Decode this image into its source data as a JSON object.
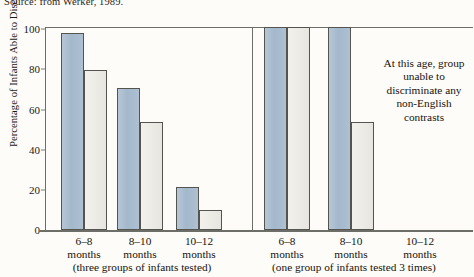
{
  "source": "Source: from Werker, 1989.",
  "axis": {
    "ylabel": "Percentage of Infants Able to Discriminate",
    "yticks": [
      "100",
      "80",
      "60",
      "40",
      "20",
      "0"
    ],
    "ymin": 0,
    "ymax": 100
  },
  "panels": [
    {
      "caption": "(three groups of infants tested)",
      "groups": [
        {
          "line1": "6–8",
          "line2": "months"
        },
        {
          "line1": "8–10",
          "line2": "months"
        },
        {
          "line1": "10–12",
          "line2": "months"
        }
      ]
    },
    {
      "caption": "(one group of infants tested 3 times)",
      "groups": [
        {
          "line1": "6–8",
          "line2": "months"
        },
        {
          "line1": "8–10",
          "line2": "months"
        },
        {
          "line1": "10–12",
          "line2": "months"
        }
      ]
    }
  ],
  "annotation": "At this age, group unable to discriminate any non-English contrasts",
  "colors": {
    "blue_bar": "#a8bcd0",
    "light_bar": "#ecebe6",
    "bar_border": "#555550",
    "axis": "#6e6e69",
    "background": "#fdfcf8",
    "text": "#16130f"
  },
  "chart_data": {
    "type": "bar",
    "title": "",
    "xlabel": "",
    "ylabel": "Percentage of Infants Able to Discriminate",
    "ylim": [
      0,
      100
    ],
    "grid": false,
    "legend": "none",
    "panels": [
      {
        "name": "three groups of infants tested",
        "categories": [
          "6–8 months",
          "8–10 months",
          "10–12 months"
        ],
        "series": [
          {
            "name": "blue",
            "values": [
              97,
              70,
              21
            ]
          },
          {
            "name": "light",
            "values": [
              79,
              53,
              10
            ]
          }
        ]
      },
      {
        "name": "one group of infants tested 3 times",
        "categories": [
          "6–8 months",
          "8–10 months",
          "10–12 months"
        ],
        "series": [
          {
            "name": "blue",
            "values": [
              100,
              100,
              null
            ]
          },
          {
            "name": "light",
            "values": [
              100,
              53,
              null
            ]
          }
        ],
        "annotation": "At this age, group unable to discriminate any non-English contrasts"
      }
    ]
  }
}
